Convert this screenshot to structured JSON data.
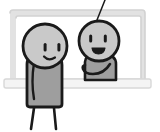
{
  "illustration": {
    "title": "Two cartoon figures standing in front of a window",
    "style": "hand-drawn black-outline line art with flat gray fills",
    "background_color": "#ffffff",
    "outline_color": "#1a1a1a",
    "canvas": {
      "width": 160,
      "height": 132
    }
  },
  "palette": {
    "background": "#ffffff",
    "outline": "#1a1a1a",
    "head_fill": "#c9c9c9",
    "body_fill": "#9e9e9e",
    "window_frame_fill": "#f2f2f2",
    "window_frame_shade": "#dcdcdc",
    "window_pane_fill": "#ffffff",
    "sill_fill": "#f4f4f4"
  },
  "elements": {
    "window": {
      "name": "window frame",
      "description": "Rounded rectangle window outline behind the figures",
      "frame_color": "#dcdcdc",
      "pane_color": "#ffffff",
      "sill_label": "window sill",
      "sill_color": "#f4f4f4"
    },
    "hanging_line": {
      "name": "hanging string",
      "description": "Thin diagonal line descending from the top edge toward the right figure's head",
      "color": "#1a1a1a"
    },
    "figure_left": {
      "name": "left figure",
      "position": "foreground left, standing in front of window sill",
      "head": {
        "shape": "circle",
        "fill": "#c9c9c9",
        "eyes": 2,
        "eye_shape": "vertical rounded bar",
        "mouth": "small upturned smile line",
        "expression": "smiling"
      },
      "body": {
        "shape": "rounded rectangle torso",
        "fill": "#9e9e9e",
        "arm": "single curved arm line on the left side of torso"
      },
      "legs": {
        "count": 2,
        "style": "thin straight lines"
      }
    },
    "figure_right": {
      "name": "right figure",
      "position": "behind the window, visible from the waist up",
      "head": {
        "shape": "circle",
        "fill": "#c9c9c9",
        "eyes": 2,
        "eye_shape": "vertical rounded bar",
        "mouth": "filled open smile (triangular)",
        "expression": "grinning"
      },
      "body": {
        "shape": "rounded shoulders torso",
        "fill": "#9e9e9e",
        "arm": "arm reaching out to the left, hooked hand"
      }
    }
  }
}
